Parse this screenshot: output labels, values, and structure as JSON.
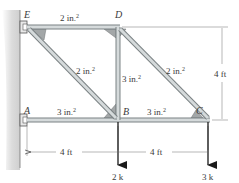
{
  "figure": {
    "joints": {
      "E": {
        "label": "E",
        "x": 27,
        "y": 27
      },
      "D": {
        "label": "D",
        "x": 118,
        "y": 27
      },
      "A": {
        "label": "A",
        "x": 27,
        "y": 120
      },
      "B": {
        "label": "B",
        "x": 118,
        "y": 120
      },
      "C": {
        "label": "C",
        "x": 208,
        "y": 120
      }
    },
    "members": {
      "ED": {
        "area": "2 in.",
        "exp": "2"
      },
      "EB": {
        "area": "2 in.",
        "exp": "2"
      },
      "BD": {
        "area": "3 in.",
        "exp": "2"
      },
      "DC": {
        "area": "2 in.",
        "exp": "2"
      },
      "AB": {
        "area": "3 in.",
        "exp": "2"
      },
      "BC": {
        "area": "3 in.",
        "exp": "2"
      }
    },
    "dimensions": {
      "AB_span": "4 ft",
      "BC_span": "4 ft",
      "height": "4 ft"
    },
    "loads": {
      "B": "2 k",
      "C": "3 k"
    },
    "colors": {
      "member": "#b9bfc0",
      "member_edge": "#7b8284",
      "gusset": "#a3a7a8",
      "wall": "#d4d4d4",
      "arrow": "#1a1a1a",
      "dim": "#9a9a9a"
    }
  }
}
